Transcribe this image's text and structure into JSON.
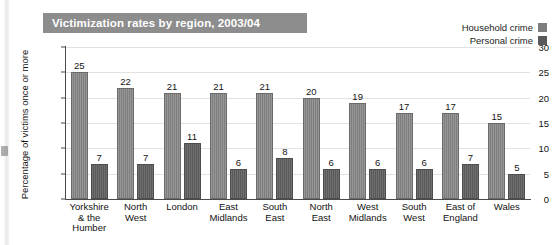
{
  "title": "Victimization rates by region, 2003/04",
  "colors": {
    "title_bar_bg": "#8d8d8d",
    "title_text": "#ffffff",
    "household": "#7d7d7d",
    "personal": "#5a5a5a",
    "axis": "#4a4a4a",
    "grid": "#e2e2e2"
  },
  "legend": {
    "items": [
      {
        "label": "Household crime",
        "color": "#7d7d7d"
      },
      {
        "label": "Personal crime",
        "color": "#5a5a5a"
      }
    ]
  },
  "axes": {
    "ylabel": "Percentage of victims once or more",
    "yticks": [
      "30",
      "25",
      "20",
      "15",
      "10",
      "5",
      "0"
    ]
  },
  "chart_data": {
    "type": "bar",
    "title": "Victimization rates by region, 2003/04",
    "xlabel": "",
    "ylabel": "Percentage of victims once or more",
    "ylim": [
      0,
      30
    ],
    "ytick_interval": 5,
    "grid": true,
    "legend_position": "top-right",
    "categories": [
      "Yorkshire & the Humber",
      "North West",
      "London",
      "East Midlands",
      "South East",
      "North East",
      "West Midlands",
      "South West",
      "East of England",
      "Wales"
    ],
    "category_lines": [
      [
        "Yorkshire",
        "& the",
        "Humber"
      ],
      [
        "North",
        "West"
      ],
      [
        "London"
      ],
      [
        "East",
        "Midlands"
      ],
      [
        "South",
        "East"
      ],
      [
        "North",
        "East"
      ],
      [
        "West",
        "Midlands"
      ],
      [
        "South",
        "West"
      ],
      [
        "East of",
        "England"
      ],
      [
        "Wales"
      ]
    ],
    "series": [
      {
        "name": "Household crime",
        "color": "#7d7d7d",
        "values": [
          25,
          22,
          21,
          21,
          21,
          20,
          19,
          17,
          17,
          15
        ]
      },
      {
        "name": "Personal crime",
        "color": "#5a5a5a",
        "values": [
          7,
          7,
          11,
          6,
          8,
          6,
          6,
          6,
          7,
          5
        ]
      }
    ]
  }
}
